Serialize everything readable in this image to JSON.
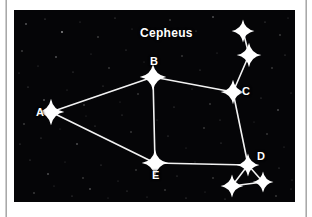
{
  "figure": {
    "name": "cepheus-constellation-diagram",
    "title": "Cepheus",
    "title_position": {
      "x": 126,
      "y": 17
    },
    "background_color": "#050507",
    "star_color": "#ffffff",
    "line_color": "#f2f2f2",
    "frame": {
      "x": 14,
      "y": 10,
      "width": 281,
      "height": 192
    }
  },
  "stars": [
    {
      "id": "A",
      "label": "A",
      "x": 37,
      "y": 102,
      "size": 7.0,
      "label_dx": -15,
      "label_dy": -5
    },
    {
      "id": "B",
      "label": "B",
      "x": 139,
      "y": 67,
      "size": 7.0,
      "label_dx": -3,
      "label_dy": -21
    },
    {
      "id": "C",
      "label": "C",
      "x": 219,
      "y": 82,
      "size": 6.5,
      "label_dx": 9,
      "label_dy": -6
    },
    {
      "id": "D",
      "label": "D",
      "x": 234,
      "y": 155,
      "size": 6.0,
      "label_dx": 9,
      "label_dy": -14
    },
    {
      "id": "E",
      "label": "E",
      "x": 141,
      "y": 153,
      "size": 7.0,
      "label_dx": -3,
      "label_dy": 7
    },
    {
      "id": "F",
      "label": "",
      "x": 229,
      "y": 21,
      "size": 6.0,
      "label_dx": 0,
      "label_dy": 0
    },
    {
      "id": "G",
      "label": "",
      "x": 235,
      "y": 45,
      "size": 6.5,
      "label_dx": 0,
      "label_dy": 0
    },
    {
      "id": "H",
      "label": "",
      "x": 218,
      "y": 176,
      "size": 6.0,
      "label_dx": 0,
      "label_dy": 0
    },
    {
      "id": "I",
      "label": "",
      "x": 249,
      "y": 172,
      "size": 5.5,
      "label_dx": 0,
      "label_dy": 0
    }
  ],
  "lines": [
    {
      "from": "A",
      "to": "B"
    },
    {
      "from": "A",
      "to": "E"
    },
    {
      "from": "B",
      "to": "C"
    },
    {
      "from": "B",
      "to": "E"
    },
    {
      "from": "C",
      "to": "D"
    },
    {
      "from": "C",
      "to": "G"
    },
    {
      "from": "G",
      "to": "F"
    },
    {
      "from": "D",
      "to": "E"
    },
    {
      "from": "D",
      "to": "H"
    },
    {
      "from": "D",
      "to": "I"
    },
    {
      "from": "H",
      "to": "I"
    }
  ],
  "background_stars": [
    {
      "x": 12,
      "y": 14,
      "r": 0.8,
      "o": 0.55
    },
    {
      "x": 31,
      "y": 9,
      "r": 0.6,
      "o": 0.4
    },
    {
      "x": 48,
      "y": 22,
      "r": 0.9,
      "o": 0.6
    },
    {
      "x": 66,
      "y": 12,
      "r": 0.5,
      "o": 0.35
    },
    {
      "x": 84,
      "y": 27,
      "r": 0.7,
      "o": 0.45
    },
    {
      "x": 101,
      "y": 8,
      "r": 0.6,
      "o": 0.38
    },
    {
      "x": 118,
      "y": 19,
      "r": 0.5,
      "o": 0.3
    },
    {
      "x": 156,
      "y": 10,
      "r": 0.7,
      "o": 0.42
    },
    {
      "x": 182,
      "y": 21,
      "r": 0.6,
      "o": 0.36
    },
    {
      "x": 199,
      "y": 7,
      "r": 0.8,
      "o": 0.5
    },
    {
      "x": 251,
      "y": 12,
      "r": 0.6,
      "o": 0.38
    },
    {
      "x": 266,
      "y": 25,
      "r": 0.7,
      "o": 0.44
    },
    {
      "x": 274,
      "y": 8,
      "r": 0.5,
      "o": 0.3
    },
    {
      "x": 8,
      "y": 41,
      "r": 0.7,
      "o": 0.45
    },
    {
      "x": 24,
      "y": 56,
      "r": 0.5,
      "o": 0.32
    },
    {
      "x": 42,
      "y": 47,
      "r": 0.8,
      "o": 0.52
    },
    {
      "x": 59,
      "y": 62,
      "r": 0.6,
      "o": 0.36
    },
    {
      "x": 77,
      "y": 44,
      "r": 0.5,
      "o": 0.3
    },
    {
      "x": 95,
      "y": 58,
      "r": 0.7,
      "o": 0.42
    },
    {
      "x": 112,
      "y": 40,
      "r": 0.6,
      "o": 0.35
    },
    {
      "x": 130,
      "y": 52,
      "r": 0.5,
      "o": 0.28
    },
    {
      "x": 168,
      "y": 46,
      "r": 0.7,
      "o": 0.4
    },
    {
      "x": 186,
      "y": 60,
      "r": 0.6,
      "o": 0.34
    },
    {
      "x": 203,
      "y": 43,
      "r": 0.5,
      "o": 0.3
    },
    {
      "x": 258,
      "y": 58,
      "r": 0.7,
      "o": 0.42
    },
    {
      "x": 271,
      "y": 45,
      "r": 0.6,
      "o": 0.36
    },
    {
      "x": 14,
      "y": 77,
      "r": 0.6,
      "o": 0.38
    },
    {
      "x": 30,
      "y": 90,
      "r": 0.8,
      "o": 0.5
    },
    {
      "x": 53,
      "y": 80,
      "r": 0.5,
      "o": 0.3
    },
    {
      "x": 70,
      "y": 95,
      "r": 0.7,
      "o": 0.44
    },
    {
      "x": 89,
      "y": 76,
      "r": 0.6,
      "o": 0.34
    },
    {
      "x": 106,
      "y": 92,
      "r": 0.5,
      "o": 0.28
    },
    {
      "x": 124,
      "y": 84,
      "r": 0.7,
      "o": 0.4
    },
    {
      "x": 160,
      "y": 97,
      "r": 0.6,
      "o": 0.36
    },
    {
      "x": 178,
      "y": 79,
      "r": 0.5,
      "o": 0.3
    },
    {
      "x": 196,
      "y": 94,
      "r": 0.7,
      "o": 0.42
    },
    {
      "x": 247,
      "y": 88,
      "r": 0.6,
      "o": 0.35
    },
    {
      "x": 264,
      "y": 100,
      "r": 0.8,
      "o": 0.48
    },
    {
      "x": 277,
      "y": 83,
      "r": 0.5,
      "o": 0.3
    },
    {
      "x": 10,
      "y": 114,
      "r": 0.7,
      "o": 0.44
    },
    {
      "x": 27,
      "y": 128,
      "r": 0.6,
      "o": 0.36
    },
    {
      "x": 46,
      "y": 119,
      "r": 0.5,
      "o": 0.28
    },
    {
      "x": 63,
      "y": 134,
      "r": 0.8,
      "o": 0.5
    },
    {
      "x": 81,
      "y": 116,
      "r": 0.6,
      "o": 0.34
    },
    {
      "x": 99,
      "y": 131,
      "r": 0.5,
      "o": 0.3
    },
    {
      "x": 117,
      "y": 122,
      "r": 0.7,
      "o": 0.4
    },
    {
      "x": 154,
      "y": 126,
      "r": 0.6,
      "o": 0.35
    },
    {
      "x": 172,
      "y": 138,
      "r": 0.5,
      "o": 0.28
    },
    {
      "x": 190,
      "y": 118,
      "r": 0.7,
      "o": 0.42
    },
    {
      "x": 207,
      "y": 133,
      "r": 0.6,
      "o": 0.34
    },
    {
      "x": 253,
      "y": 124,
      "r": 0.7,
      "o": 0.4
    },
    {
      "x": 270,
      "y": 137,
      "r": 0.5,
      "o": 0.3
    },
    {
      "x": 16,
      "y": 150,
      "r": 0.6,
      "o": 0.36
    },
    {
      "x": 34,
      "y": 164,
      "r": 0.8,
      "o": 0.5
    },
    {
      "x": 51,
      "y": 152,
      "r": 0.5,
      "o": 0.28
    },
    {
      "x": 69,
      "y": 168,
      "r": 0.7,
      "o": 0.42
    },
    {
      "x": 87,
      "y": 155,
      "r": 0.6,
      "o": 0.34
    },
    {
      "x": 104,
      "y": 171,
      "r": 0.5,
      "o": 0.3
    },
    {
      "x": 122,
      "y": 160,
      "r": 0.7,
      "o": 0.4
    },
    {
      "x": 163,
      "y": 166,
      "r": 0.6,
      "o": 0.35
    },
    {
      "x": 181,
      "y": 152,
      "r": 0.5,
      "o": 0.28
    },
    {
      "x": 199,
      "y": 168,
      "r": 0.7,
      "o": 0.42
    },
    {
      "x": 265,
      "y": 158,
      "r": 0.6,
      "o": 0.36
    },
    {
      "x": 278,
      "y": 170,
      "r": 0.5,
      "o": 0.3
    },
    {
      "x": 20,
      "y": 183,
      "r": 0.7,
      "o": 0.44
    },
    {
      "x": 40,
      "y": 176,
      "r": 0.5,
      "o": 0.3
    },
    {
      "x": 58,
      "y": 186,
      "r": 0.6,
      "o": 0.36
    },
    {
      "x": 76,
      "y": 179,
      "r": 0.8,
      "o": 0.48
    },
    {
      "x": 94,
      "y": 188,
      "r": 0.5,
      "o": 0.28
    },
    {
      "x": 113,
      "y": 181,
      "r": 0.6,
      "o": 0.34
    },
    {
      "x": 133,
      "y": 187,
      "r": 0.5,
      "o": 0.3
    },
    {
      "x": 151,
      "y": 180,
      "r": 0.7,
      "o": 0.4
    },
    {
      "x": 172,
      "y": 188,
      "r": 0.6,
      "o": 0.35
    },
    {
      "x": 191,
      "y": 182,
      "r": 0.5,
      "o": 0.28
    },
    {
      "x": 211,
      "y": 189,
      "r": 0.6,
      "o": 0.34
    },
    {
      "x": 262,
      "y": 186,
      "r": 0.7,
      "o": 0.42
    },
    {
      "x": 277,
      "y": 179,
      "r": 0.5,
      "o": 0.3
    },
    {
      "x": 5,
      "y": 63,
      "r": 0.5,
      "o": 0.3
    },
    {
      "x": 6,
      "y": 134,
      "r": 0.6,
      "o": 0.34
    },
    {
      "x": 143,
      "y": 110,
      "r": 0.5,
      "o": 0.26
    },
    {
      "x": 108,
      "y": 105,
      "r": 0.6,
      "o": 0.32
    },
    {
      "x": 72,
      "y": 106,
      "r": 0.5,
      "o": 0.26
    },
    {
      "x": 206,
      "y": 110,
      "r": 0.6,
      "o": 0.3
    },
    {
      "x": 240,
      "y": 112,
      "r": 0.5,
      "o": 0.26
    }
  ]
}
